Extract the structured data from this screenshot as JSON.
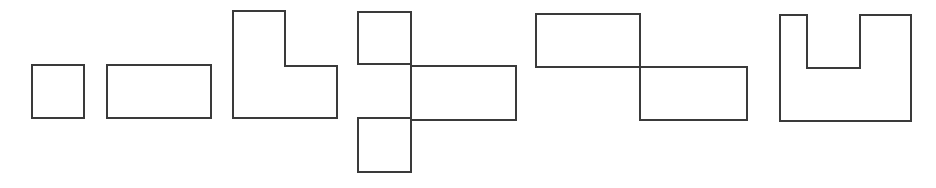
{
  "diagram": {
    "stroke_color": "#3a3a3a",
    "background": "#ffffff",
    "shapes": [
      {
        "id": "square",
        "label": "",
        "path": "M32 65 H84 V118 H32 Z"
      },
      {
        "id": "rectangle",
        "label": "",
        "path": "M107 65 H211 V118 H107 Z"
      },
      {
        "id": "l-shape",
        "label": "",
        "path": "M233 11 H285 V66 H337 V118 H233 Z"
      },
      {
        "id": "t-cross-shape",
        "label": "",
        "path": "M358 12 H411 V64 H358 Z M411 66 H516 V120 H411 Z M358 118 H411 V172 H358 Z M411 64 V118"
      },
      {
        "id": "z-step-shape",
        "label": "",
        "path": "M536 14 H640 V67 H536 Z M640 67 H747 V120 H640 Z"
      },
      {
        "id": "u-shape",
        "label": "",
        "path": "M780 15 H807 V68 H860 V15 H911 V121 H780 Z"
      }
    ]
  }
}
